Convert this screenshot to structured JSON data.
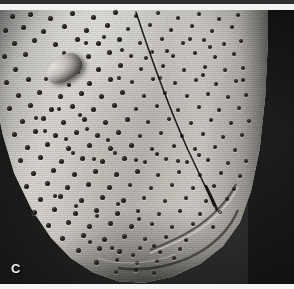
{
  "figure": {
    "kind": "sem-micrograph",
    "panel_label": "C",
    "title_text": "",
    "caption_text": "",
    "scale_bar_text": "",
    "background_color": "#1a1a1a",
    "specimen_color": "#cfccc6",
    "label_color": "#f4f4f2"
  },
  "bands": {
    "top_dark_color": "#2e2e2e",
    "top_light_color": "#f2f2f0",
    "bottom_light_color": "#f4f4f2"
  },
  "features": {
    "raphe_label": "raphe",
    "rimoportula_label": "rimoportula",
    "areolae_label": "areolae",
    "mantle_label": "mantle-fold"
  },
  "areolae": [
    [
      12,
      6,
      5
    ],
    [
      30,
      4,
      5
    ],
    [
      50,
      8,
      5
    ],
    [
      72,
      3,
      5
    ],
    [
      93,
      7,
      5
    ],
    [
      115,
      2,
      5
    ],
    [
      136,
      6,
      4
    ],
    [
      158,
      3,
      4
    ],
    [
      178,
      8,
      4
    ],
    [
      199,
      4,
      4
    ],
    [
      219,
      9,
      4
    ],
    [
      238,
      5,
      4
    ],
    [
      5,
      20,
      5
    ],
    [
      23,
      17,
      5
    ],
    [
      43,
      21,
      5
    ],
    [
      64,
      16,
      5
    ],
    [
      86,
      20,
      5
    ],
    [
      107,
      15,
      5
    ],
    [
      128,
      19,
      4
    ],
    [
      150,
      15,
      4
    ],
    [
      171,
      20,
      4
    ],
    [
      192,
      16,
      4
    ],
    [
      212,
      21,
      4
    ],
    [
      232,
      17,
      4
    ],
    [
      14,
      33,
      5
    ],
    [
      34,
      30,
      5
    ],
    [
      55,
      34,
      5
    ],
    [
      77,
      29,
      5
    ],
    [
      98,
      33,
      5
    ],
    [
      119,
      29,
      5
    ],
    [
      140,
      33,
      4
    ],
    [
      162,
      29,
      4
    ],
    [
      183,
      33,
      4
    ],
    [
      204,
      30,
      4
    ],
    [
      224,
      34,
      4
    ],
    [
      241,
      31,
      4
    ],
    [
      4,
      46,
      5
    ],
    [
      25,
      44,
      5
    ],
    [
      88,
      46,
      5
    ],
    [
      109,
      42,
      5
    ],
    [
      131,
      46,
      4
    ],
    [
      152,
      42,
      4
    ],
    [
      173,
      46,
      4
    ],
    [
      195,
      43,
      4
    ],
    [
      215,
      47,
      4
    ],
    [
      234,
      44,
      4
    ],
    [
      15,
      59,
      5
    ],
    [
      98,
      59,
      5
    ],
    [
      120,
      55,
      5
    ],
    [
      141,
      59,
      4
    ],
    [
      163,
      56,
      4
    ],
    [
      184,
      60,
      4
    ],
    [
      205,
      57,
      4
    ],
    [
      225,
      60,
      4
    ],
    [
      243,
      58,
      4
    ],
    [
      6,
      72,
      5
    ],
    [
      28,
      69,
      5
    ],
    [
      89,
      73,
      5
    ],
    [
      110,
      69,
      5
    ],
    [
      132,
      72,
      4
    ],
    [
      153,
      69,
      4
    ],
    [
      175,
      73,
      4
    ],
    [
      196,
      70,
      4
    ],
    [
      216,
      74,
      4
    ],
    [
      236,
      71,
      4
    ],
    [
      18,
      85,
      5
    ],
    [
      39,
      82,
      5
    ],
    [
      60,
      86,
      5
    ],
    [
      81,
      83,
      5
    ],
    [
      101,
      86,
      5
    ],
    [
      122,
      82,
      5
    ],
    [
      144,
      86,
      4
    ],
    [
      165,
      83,
      4
    ],
    [
      187,
      86,
      4
    ],
    [
      208,
      84,
      4
    ],
    [
      228,
      87,
      4
    ],
    [
      246,
      85,
      4
    ],
    [
      9,
      98,
      5
    ],
    [
      30,
      95,
      5
    ],
    [
      51,
      99,
      5
    ],
    [
      72,
      96,
      5
    ],
    [
      93,
      99,
      5
    ],
    [
      114,
      95,
      5
    ],
    [
      136,
      99,
      4
    ],
    [
      157,
      96,
      4
    ],
    [
      178,
      100,
      4
    ],
    [
      199,
      97,
      4
    ],
    [
      219,
      100,
      4
    ],
    [
      239,
      98,
      4
    ],
    [
      22,
      111,
      5
    ],
    [
      43,
      108,
      5
    ],
    [
      63,
      112,
      5
    ],
    [
      84,
      109,
      5
    ],
    [
      105,
      112,
      5
    ],
    [
      127,
      109,
      5
    ],
    [
      148,
      112,
      4
    ],
    [
      169,
      109,
      4
    ],
    [
      191,
      113,
      4
    ],
    [
      211,
      110,
      4
    ],
    [
      231,
      113,
      4
    ],
    [
      249,
      111,
      4
    ],
    [
      14,
      124,
      5
    ],
    [
      35,
      121,
      5
    ],
    [
      55,
      125,
      5
    ],
    [
      76,
      122,
      5
    ],
    [
      97,
      125,
      5
    ],
    [
      118,
      122,
      5
    ],
    [
      140,
      126,
      4
    ],
    [
      161,
      123,
      4
    ],
    [
      182,
      126,
      4
    ],
    [
      203,
      124,
      4
    ],
    [
      223,
      127,
      4
    ],
    [
      242,
      125,
      4
    ],
    [
      27,
      137,
      5
    ],
    [
      47,
      134,
      5
    ],
    [
      68,
      138,
      5
    ],
    [
      89,
      135,
      5
    ],
    [
      110,
      138,
      5
    ],
    [
      131,
      135,
      5
    ],
    [
      152,
      139,
      4
    ],
    [
      174,
      136,
      4
    ],
    [
      195,
      139,
      4
    ],
    [
      215,
      137,
      4
    ],
    [
      235,
      140,
      4
    ],
    [
      20,
      150,
      5
    ],
    [
      40,
      147,
      5
    ],
    [
      61,
      151,
      5
    ],
    [
      82,
      148,
      5
    ],
    [
      102,
      151,
      5
    ],
    [
      124,
      148,
      5
    ],
    [
      145,
      152,
      4
    ],
    [
      166,
      149,
      4
    ],
    [
      187,
      152,
      4
    ],
    [
      208,
      150,
      4
    ],
    [
      228,
      153,
      4
    ],
    [
      246,
      151,
      4
    ],
    [
      33,
      163,
      5
    ],
    [
      53,
      160,
      5
    ],
    [
      74,
      164,
      5
    ],
    [
      95,
      161,
      5
    ],
    [
      116,
      164,
      5
    ],
    [
      137,
      161,
      5
    ],
    [
      158,
      165,
      4
    ],
    [
      179,
      162,
      4
    ],
    [
      200,
      165,
      4
    ],
    [
      221,
      163,
      4
    ],
    [
      240,
      166,
      4
    ],
    [
      26,
      176,
      5
    ],
    [
      47,
      173,
      5
    ],
    [
      67,
      177,
      5
    ],
    [
      88,
      174,
      5
    ],
    [
      109,
      177,
      5
    ],
    [
      130,
      175,
      4
    ],
    [
      151,
      178,
      4
    ],
    [
      172,
      175,
      4
    ],
    [
      193,
      178,
      4
    ],
    [
      214,
      176,
      4
    ],
    [
      234,
      179,
      4
    ],
    [
      40,
      189,
      5
    ],
    [
      60,
      186,
      5
    ],
    [
      81,
      190,
      5
    ],
    [
      102,
      187,
      5
    ],
    [
      123,
      190,
      5
    ],
    [
      144,
      188,
      4
    ],
    [
      165,
      191,
      4
    ],
    [
      186,
      188,
      4
    ],
    [
      206,
      191,
      4
    ],
    [
      227,
      189,
      4
    ],
    [
      34,
      202,
      5
    ],
    [
      54,
      199,
      5
    ],
    [
      75,
      203,
      5
    ],
    [
      96,
      200,
      5
    ],
    [
      117,
      203,
      5
    ],
    [
      138,
      201,
      4
    ],
    [
      159,
      204,
      4
    ],
    [
      180,
      201,
      4
    ],
    [
      200,
      204,
      4
    ],
    [
      220,
      202,
      4
    ],
    [
      48,
      215,
      5
    ],
    [
      68,
      212,
      5
    ],
    [
      89,
      216,
      5
    ],
    [
      110,
      213,
      5
    ],
    [
      131,
      216,
      5
    ],
    [
      152,
      214,
      4
    ],
    [
      172,
      217,
      4
    ],
    [
      193,
      214,
      4
    ],
    [
      213,
      217,
      4
    ],
    [
      62,
      228,
      5
    ],
    [
      83,
      225,
      5
    ],
    [
      104,
      229,
      5
    ],
    [
      124,
      226,
      5
    ],
    [
      145,
      229,
      4
    ],
    [
      166,
      227,
      4
    ],
    [
      186,
      230,
      4
    ],
    [
      78,
      240,
      5
    ],
    [
      99,
      238,
      5
    ],
    [
      119,
      241,
      5
    ],
    [
      140,
      238,
      4
    ],
    [
      160,
      242,
      4
    ],
    [
      180,
      239,
      4
    ],
    [
      96,
      252,
      5
    ],
    [
      117,
      250,
      4
    ],
    [
      137,
      253,
      4
    ],
    [
      157,
      251,
      4
    ],
    [
      116,
      262,
      4
    ],
    [
      136,
      260,
      4
    ],
    [
      154,
      263,
      4
    ],
    [
      64,
      43,
      4
    ],
    [
      86,
      33,
      4
    ],
    [
      104,
      27,
      4
    ],
    [
      122,
      40,
      4
    ],
    [
      146,
      48,
      4
    ],
    [
      167,
      41,
      4
    ],
    [
      190,
      29,
      4
    ],
    [
      210,
      37,
      4
    ],
    [
      57,
      56,
      4
    ],
    [
      78,
      62,
      4
    ],
    [
      46,
      69,
      4
    ],
    [
      69,
      75,
      4
    ],
    [
      119,
      68,
      4
    ],
    [
      160,
      68,
      4
    ],
    [
      203,
      65,
      4
    ],
    [
      243,
      70,
      4
    ],
    [
      36,
      108,
      4
    ],
    [
      59,
      99,
      4
    ],
    [
      80,
      105,
      4
    ],
    [
      45,
      121,
      4
    ],
    [
      66,
      129,
      4
    ],
    [
      87,
      119,
      4
    ],
    [
      108,
      130,
      4
    ],
    [
      73,
      143,
      4
    ],
    [
      94,
      149,
      4
    ],
    [
      115,
      143,
      4
    ],
    [
      136,
      150,
      4
    ],
    [
      157,
      144,
      4
    ],
    [
      178,
      151,
      4
    ],
    [
      199,
      145,
      4
    ],
    [
      55,
      186,
      4
    ],
    [
      76,
      196,
      4
    ],
    [
      97,
      206,
      4
    ],
    [
      118,
      194,
      4
    ],
    [
      139,
      209,
      4
    ],
    [
      90,
      232,
      4
    ],
    [
      112,
      238,
      4
    ],
    [
      133,
      245,
      4
    ],
    [
      154,
      236,
      4
    ],
    [
      174,
      248,
      4
    ]
  ]
}
